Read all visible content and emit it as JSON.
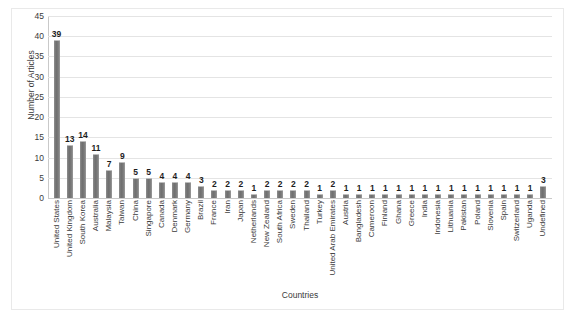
{
  "chart_data": {
    "type": "bar",
    "title": "",
    "xlabel": "Countries",
    "ylabel": "Number of Articles",
    "ylim": [
      0,
      45
    ],
    "ytick_step": 5,
    "yticks": [
      45,
      40,
      35,
      30,
      25,
      20,
      15,
      10,
      5,
      0
    ],
    "grid": true,
    "legend": "none",
    "bar_color": "#7a7a7a",
    "label_color": "#1d1d1d",
    "categories": [
      "United States",
      "United Kingdom",
      "South Korea",
      "Australia",
      "Malaysia",
      "Taiwan",
      "China",
      "Singapore",
      "Canada",
      "Denmark",
      "Germany",
      "Brazil",
      "France",
      "Iran",
      "Japan",
      "Netherlands",
      "New Zealand",
      "South Africa",
      "Sweden",
      "Thailand",
      "Turkey",
      "United Arab Emirates",
      "Austria",
      "Bangladesh",
      "Cameroon",
      "Finland",
      "Ghana",
      "Greece",
      "India",
      "Indonesia",
      "Lithuania",
      "Pakistan",
      "Poland",
      "Slovenia",
      "Spain",
      "Switzerland",
      "Uganda",
      "Undefined"
    ],
    "values": [
      39,
      13,
      14,
      11,
      7,
      9,
      5,
      5,
      4,
      4,
      4,
      3,
      2,
      2,
      2,
      1,
      2,
      2,
      2,
      2,
      1,
      2,
      1,
      1,
      1,
      1,
      1,
      1,
      1,
      1,
      1,
      1,
      1,
      1,
      1,
      1,
      1,
      3
    ]
  }
}
